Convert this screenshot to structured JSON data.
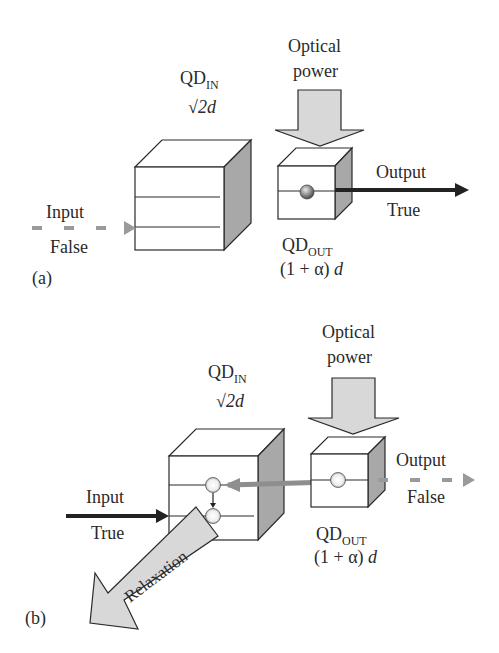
{
  "colors": {
    "line": "#2a2a2a",
    "face_front": "#ffffff",
    "face_side": "#a8a8a8",
    "arrow_fill": "#d8d8d8",
    "dashed_arrow": "#9a9a9a",
    "solid_arrow": "#222222"
  },
  "panel_a": {
    "tag": "(a)",
    "qd_in": {
      "name": "QD",
      "subscript": "IN",
      "size": "√2d"
    },
    "qd_out": {
      "name": "QD",
      "subscript": "OUT",
      "size_prefix": "(1 + α) ",
      "size_var": "d"
    },
    "optical_power": {
      "line1": "Optical",
      "line2": "power"
    },
    "input": {
      "label": "Input",
      "state": "False"
    },
    "output": {
      "label": "Output",
      "state": "True"
    }
  },
  "panel_b": {
    "tag": "(b)",
    "qd_in": {
      "name": "QD",
      "subscript": "IN",
      "size": "√2d"
    },
    "qd_out": {
      "name": "QD",
      "subscript": "OUT",
      "size_prefix": "(1 + α) ",
      "size_var": "d"
    },
    "optical_power": {
      "line1": "Optical",
      "line2": "power"
    },
    "input": {
      "label": "Input",
      "state": "True"
    },
    "output": {
      "label": "Output",
      "state": "False"
    },
    "relaxation": "Relaxation"
  }
}
